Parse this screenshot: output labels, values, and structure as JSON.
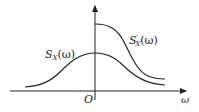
{
  "diagram": {
    "type": "spectral density curves",
    "labels": {
      "curve_lower": "S",
      "curve_lower_sub": "X",
      "curve_lower_arg": "(ω)",
      "curve_upper": "S",
      "curve_upper_sub": "X",
      "curve_upper_sup": "′",
      "curve_upper_arg": "(ω)",
      "origin": "O",
      "x_axis": "ω"
    },
    "colors": {
      "stroke": "#222222",
      "background": "#ffffff"
    }
  }
}
